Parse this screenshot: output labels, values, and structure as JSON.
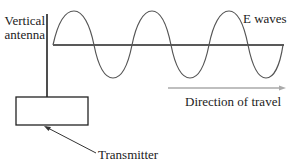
{
  "labels": {
    "antenna_line1": "Vertical",
    "antenna_line2": "antenna",
    "e_waves": "E waves",
    "direction": "Direction of travel",
    "transmitter": "Transmitter"
  },
  "colors": {
    "stroke": "#222222",
    "wave": "#555555",
    "direction_arrow": "#aaaaaa"
  }
}
